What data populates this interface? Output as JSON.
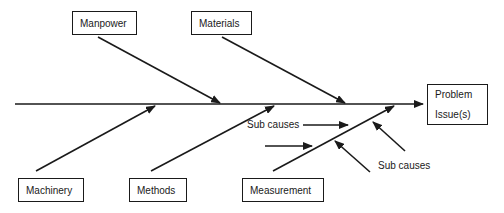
{
  "diagram": {
    "type": "fishbone",
    "effect": {
      "line1": "Problem",
      "line2": "Issue(s)"
    },
    "causes_top": [
      {
        "label": "Manpower"
      },
      {
        "label": "Materials"
      }
    ],
    "causes_bottom": [
      {
        "label": "Machinery"
      },
      {
        "label": "Methods"
      },
      {
        "label": "Measurement"
      }
    ],
    "sub_cause_labels": [
      {
        "label": "Sub causes"
      },
      {
        "label": "Sub causes"
      }
    ],
    "colors": {
      "line": "#1a1a1a",
      "background": "#ffffff"
    }
  }
}
